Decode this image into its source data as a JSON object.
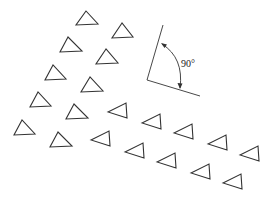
{
  "figure": {
    "stroke_color": "#333333",
    "background": "#ffffff"
  },
  "angle_annotation": {
    "label": "90°",
    "vertex": [
      147,
      80
    ],
    "ray1_end": [
      163,
      25
    ],
    "ray2_end": [
      200,
      96
    ]
  },
  "triangles_up": [
    {
      "apex": [
        86,
        11
      ],
      "bl": [
        76,
        25
      ],
      "br": [
        98,
        24
      ]
    },
    {
      "apex": [
        122,
        23
      ],
      "bl": [
        112,
        38
      ],
      "br": [
        133,
        37
      ]
    },
    {
      "apex": [
        68,
        37
      ],
      "bl": [
        60,
        52
      ],
      "br": [
        82,
        51
      ]
    },
    {
      "apex": [
        106,
        49
      ],
      "bl": [
        96,
        64
      ],
      "br": [
        118,
        63
      ]
    },
    {
      "apex": [
        53,
        65
      ],
      "bl": [
        45,
        80
      ],
      "br": [
        66,
        79
      ]
    },
    {
      "apex": [
        90,
        77
      ],
      "bl": [
        81,
        92
      ],
      "br": [
        103,
        91
      ]
    },
    {
      "apex": [
        38,
        92
      ],
      "bl": [
        30,
        107
      ],
      "br": [
        51,
        106
      ]
    },
    {
      "apex": [
        74,
        104
      ],
      "bl": [
        66,
        119
      ],
      "br": [
        88,
        118
      ]
    },
    {
      "apex": [
        22,
        120
      ],
      "bl": [
        14,
        135
      ],
      "br": [
        35,
        134
      ]
    },
    {
      "apex": [
        58,
        132
      ],
      "bl": [
        50,
        147
      ],
      "br": [
        72,
        146
      ]
    }
  ],
  "triangles_left": [
    {
      "tip": [
        108,
        112
      ],
      "top": [
        126,
        103
      ],
      "bottom": [
        127,
        118
      ]
    },
    {
      "tip": [
        142,
        123
      ],
      "top": [
        160,
        114
      ],
      "bottom": [
        161,
        129
      ]
    },
    {
      "tip": [
        174,
        133
      ],
      "top": [
        192,
        124
      ],
      "bottom": [
        193,
        139
      ]
    },
    {
      "tip": [
        208,
        144
      ],
      "top": [
        226,
        135
      ],
      "bottom": [
        227,
        150
      ]
    },
    {
      "tip": [
        240,
        155
      ],
      "top": [
        258,
        146
      ],
      "bottom": [
        259,
        161
      ]
    },
    {
      "tip": [
        91,
        140
      ],
      "top": [
        109,
        131
      ],
      "bottom": [
        110,
        146
      ]
    },
    {
      "tip": [
        125,
        152
      ],
      "top": [
        143,
        143
      ],
      "bottom": [
        144,
        158
      ]
    },
    {
      "tip": [
        157,
        162
      ],
      "top": [
        175,
        153
      ],
      "bottom": [
        176,
        168
      ]
    },
    {
      "tip": [
        191,
        173
      ],
      "top": [
        209,
        164
      ],
      "bottom": [
        210,
        179
      ]
    },
    {
      "tip": [
        223,
        183
      ],
      "top": [
        241,
        174
      ],
      "bottom": [
        242,
        189
      ]
    }
  ]
}
